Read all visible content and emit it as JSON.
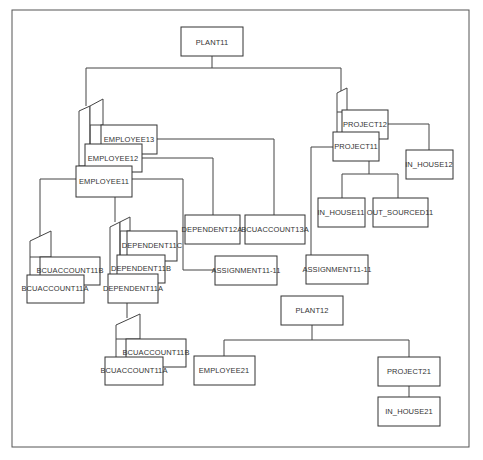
{
  "diagram": {
    "type": "hierarchical database occurrence tree",
    "trees": [
      {
        "root": "PLANT11",
        "children": [
          {
            "name": "EMPLOYEE11",
            "twins": [
              "EMPLOYEE11",
              "EMPLOYEE12",
              "EMPLOYEE13"
            ],
            "children": {
              "EMPLOYEE11": [
                "BCUACCOUNT11A",
                "BCUACCOUNT11B",
                "DEPENDENT11A",
                "DEPENDENT11B",
                "DEPENDENT11C",
                "ASSIGNMENT11-11"
              ],
              "EMPLOYEE12": [
                "DEPENDENT12A"
              ],
              "EMPLOYEE13": [
                "BCUACCOUNT13A"
              ],
              "DEPENDENT11A": [
                "BCUACCOUNT11A",
                "BCUACCOUNT11B"
              ]
            }
          },
          {
            "name": "PROJECT11",
            "twins": [
              "PROJECT11",
              "PROJECT12"
            ],
            "children": {
              "PROJECT11": [
                "IN_HOUSE11",
                "OUT_SOURCED11",
                "ASSIGNMENT11-11"
              ],
              "PROJECT12": [
                "IN_HOUSE12"
              ]
            }
          }
        ]
      },
      {
        "root": "PLANT12",
        "children": [
          {
            "name": "EMPLOYEE21"
          },
          {
            "name": "PROJECT21",
            "children": {
              "PROJECT21": [
                "IN_HOUSE21"
              ]
            }
          }
        ]
      }
    ]
  },
  "labels": {
    "plant11": "PLANT11",
    "employee13": "EMPLOYEE13",
    "employee12": "EMPLOYEE12",
    "employee11": "EMPLOYEE11",
    "bcuaccount11b_e": "BCUACCOUNT11B",
    "bcuaccount11a_e": "BCUACCOUNT11A",
    "dependent11c": "DEPENDENT11C",
    "dependent11b": "DEPENDENT11B",
    "dependent11a": "DEPENDENT11A",
    "bcuaccount11b_d": "BCUACCOUNT11B",
    "bcuaccount11a_d": "BCUACCOUNT11A",
    "dependent12a": "DEPENDENT12A",
    "bcuaccount13a": "BCUACCOUNT13A",
    "assignment_emp": "ASSIGNMENT11-11",
    "project12": "PROJECT12",
    "project11": "PROJECT11",
    "in_house12": "IN_HOUSE12",
    "in_house11": "IN_HOUSE11",
    "out_sourced11": "OUT_SOURCED11",
    "assignment_proj": "ASSIGNMENT11-11",
    "plant12": "PLANT12",
    "employee21": "EMPLOYEE21",
    "project21": "PROJECT21",
    "in_house21": "IN_HOUSE21"
  }
}
